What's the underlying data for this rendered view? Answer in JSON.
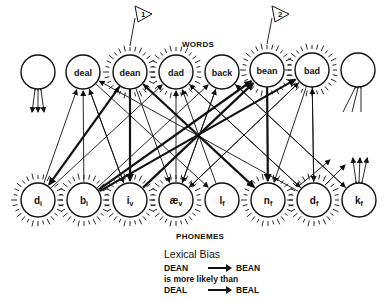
{
  "labels": {
    "words": "WORDS",
    "phonemes": "PHONEMES"
  },
  "words": [
    {
      "id": "w0",
      "label": "",
      "x": 38,
      "y": 72,
      "active": false
    },
    {
      "id": "deal",
      "label": "deal",
      "x": 83,
      "y": 72,
      "active": false
    },
    {
      "id": "dean",
      "label": "dean",
      "x": 130,
      "y": 72,
      "active": true,
      "flag": "1"
    },
    {
      "id": "dad",
      "label": "dad",
      "x": 176,
      "y": 72,
      "active": true
    },
    {
      "id": "back",
      "label": "back",
      "x": 222,
      "y": 72,
      "active": false
    },
    {
      "id": "bean",
      "label": "bean",
      "x": 267,
      "y": 70,
      "active": true,
      "flag": "2"
    },
    {
      "id": "bad",
      "label": "bad",
      "x": 312,
      "y": 70,
      "active": true
    },
    {
      "id": "w7",
      "label": "",
      "x": 358,
      "y": 70,
      "active": false
    }
  ],
  "phonemes": [
    {
      "id": "di",
      "label": "d",
      "sub": "i",
      "x": 38,
      "y": 200,
      "active": true
    },
    {
      "id": "bi",
      "label": "b",
      "sub": "i",
      "x": 84,
      "y": 200,
      "active": true
    },
    {
      "id": "iv",
      "label": "i",
      "sub": "v",
      "x": 130,
      "y": 200,
      "active": true
    },
    {
      "id": "aev",
      "label": "æ",
      "sub": "v",
      "x": 176,
      "y": 200,
      "active": true
    },
    {
      "id": "lf",
      "label": "l",
      "sub": "f",
      "x": 222,
      "y": 200,
      "active": false
    },
    {
      "id": "nf",
      "label": "n",
      "sub": "f",
      "x": 268,
      "y": 200,
      "active": true
    },
    {
      "id": "df",
      "label": "d",
      "sub": "f",
      "x": 314,
      "y": 200,
      "active": true
    },
    {
      "id": "kf",
      "label": "k",
      "sub": "f",
      "x": 359,
      "y": 200,
      "active": false
    }
  ],
  "legend": {
    "title": "Lexical Bias",
    "row1_from": "DEAN",
    "row1_to": "BEAN",
    "row2": "is more likely than",
    "row3_from": "DEAL",
    "row3_to": "BEAL"
  }
}
